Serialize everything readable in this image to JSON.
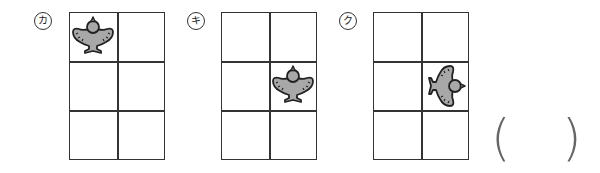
{
  "panels": [
    {
      "label": "カ",
      "bird_cell": {
        "row": 0,
        "col": 0
      },
      "rotation_deg": 0
    },
    {
      "label": "キ",
      "bird_cell": {
        "row": 1,
        "col": 1
      },
      "rotation_deg": 0
    },
    {
      "label": "ク",
      "bird_cell": {
        "row": 1,
        "col": 1
      },
      "rotation_deg": 90
    }
  ],
  "answer": {
    "open": "(",
    "close": ")",
    "value": ""
  },
  "colors": {
    "grid_line": "#333333",
    "bird_fill": "#a8a8a8",
    "bird_outline": "#222222"
  }
}
